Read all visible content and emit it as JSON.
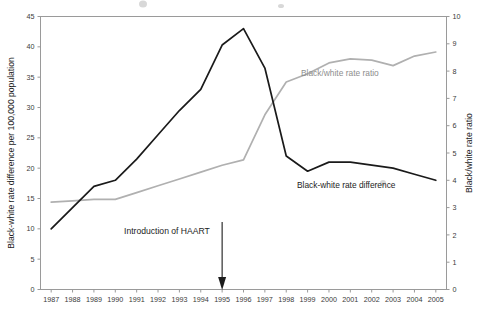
{
  "chart_data": {
    "type": "line",
    "title": "",
    "xlabel": "",
    "x": [
      1987,
      1988,
      1989,
      1990,
      1991,
      1992,
      1993,
      1994,
      1995,
      1996,
      1997,
      1998,
      1999,
      2000,
      2001,
      2002,
      2003,
      2004,
      2005
    ],
    "xtick_labels": [
      "1987",
      "1988",
      "1989",
      "1990",
      "1991",
      "1992",
      "1993",
      "1994",
      "1995",
      "1996",
      "1997",
      "1998",
      "1999",
      "2000",
      "2001",
      "2002",
      "2003",
      "2004",
      "2005"
    ],
    "grid": false,
    "legend_position": "inline-annotations",
    "axes": [
      {
        "id": "left",
        "label": "Black-white rate difference per 100,000 population",
        "ylim": [
          0,
          45
        ],
        "ticks": [
          0,
          5,
          10,
          15,
          20,
          25,
          30,
          35,
          40,
          45
        ],
        "tick_labels": [
          "0",
          "5",
          "10",
          "15",
          "20",
          "25",
          "30",
          "35",
          "40",
          "45"
        ]
      },
      {
        "id": "right",
        "label": "Black/white rate ratio",
        "ylim": [
          0,
          10
        ],
        "ticks": [
          0,
          1,
          2,
          3,
          4,
          5,
          6,
          7,
          8,
          9,
          10
        ],
        "tick_labels": [
          "0",
          "1",
          "2",
          "3",
          "4",
          "5",
          "6",
          "7",
          "8",
          "9",
          "10"
        ]
      }
    ],
    "series": [
      {
        "name": "Black-white rate difference",
        "axis": "left",
        "color": "#1a1a1a",
        "label_text": "Black-white rate difference",
        "values": [
          10.0,
          13.5,
          17.0,
          18.0,
          21.5,
          25.5,
          29.5,
          33.0,
          40.3,
          43.0,
          36.5,
          22.0,
          19.5,
          21.0,
          21.0,
          20.5,
          20.0,
          19.0,
          18.0
        ]
      },
      {
        "name": "Black/white rate ratio",
        "axis": "right",
        "color": "#b0b0b0",
        "label_text": "Black/white rate ratio",
        "values": [
          3.2,
          3.25,
          3.3,
          3.3,
          3.55,
          3.8,
          4.05,
          4.3,
          4.55,
          4.75,
          6.4,
          7.6,
          7.9,
          8.3,
          8.45,
          8.4,
          8.2,
          8.55,
          8.7
        ]
      }
    ],
    "annotations": [
      {
        "text": "Introduction of HAART",
        "target_year": 1995,
        "type": "arrow-down"
      }
    ]
  }
}
